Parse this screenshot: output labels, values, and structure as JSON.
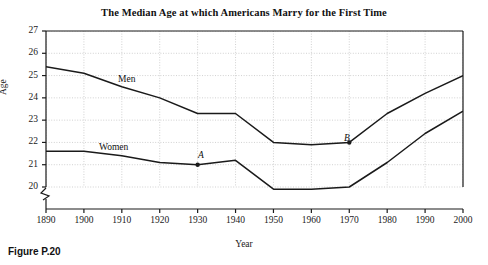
{
  "chart_data": {
    "type": "line",
    "title": "The Median Age at which Americans Marry for the First Time",
    "xlabel": "Year",
    "ylabel": "Age",
    "xlim": [
      1890,
      2000
    ],
    "ylim": [
      20,
      27
    ],
    "xticks": [
      1890,
      1900,
      1910,
      1920,
      1930,
      1940,
      1950,
      1960,
      1970,
      1980,
      1990,
      2000
    ],
    "yticks": [
      20,
      21,
      22,
      23,
      24,
      25,
      26,
      27
    ],
    "grid": true,
    "axis_break": true,
    "legend_position": "inline",
    "x": [
      1890,
      1900,
      1910,
      1920,
      1930,
      1940,
      1950,
      1960,
      1970,
      1980,
      1990,
      2000
    ],
    "series": [
      {
        "name": "Men",
        "values": [
          25.4,
          25.1,
          24.5,
          24.0,
          23.3,
          23.3,
          22.0,
          21.9,
          22.0,
          23.3,
          24.2,
          25.0
        ]
      },
      {
        "name": "Women",
        "values": [
          21.6,
          21.6,
          21.4,
          21.1,
          21.0,
          21.2,
          19.9,
          19.9,
          20.0,
          21.1,
          22.4,
          23.4
        ]
      }
    ],
    "annotations": [
      {
        "label": "A",
        "x": 1930,
        "y": 21.0,
        "series": "Women"
      },
      {
        "label": "B",
        "x": 1970,
        "y": 22.0,
        "series": "Men"
      }
    ]
  },
  "labels": {
    "men": "Men",
    "women": "Women",
    "point_a": "A",
    "point_b": "B"
  },
  "caption": "Figure P.20",
  "colors": {
    "line": "#1a1a1a",
    "grid": "#bdbdbd",
    "axis": "#1a1a1a",
    "background": "#ffffff"
  }
}
